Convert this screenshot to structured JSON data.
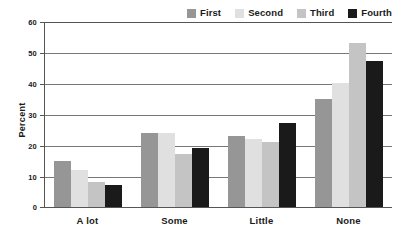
{
  "chart_data": {
    "type": "bar",
    "title": "",
    "subtitle": "",
    "xlabel": "",
    "ylabel": "Percent",
    "ylim": [
      0,
      60
    ],
    "yticks": [
      0,
      10,
      20,
      30,
      40,
      50,
      60
    ],
    "ytick_labels": [
      "0",
      "10",
      "20",
      "30",
      "40",
      "50",
      "60"
    ],
    "grid": true,
    "grid_axis": "y",
    "legend_position": "top-right",
    "categories": [
      "A lot",
      "Some",
      "Little",
      "None"
    ],
    "series": [
      {
        "name": "First",
        "color": "#969696",
        "values": [
          15,
          24,
          23,
          35
        ]
      },
      {
        "name": "Second",
        "color": "#e0e0e0",
        "values": [
          12,
          24,
          22,
          40
        ]
      },
      {
        "name": "Third",
        "color": "#c4c4c4",
        "values": [
          8,
          17,
          21,
          53
        ]
      },
      {
        "name": "Fourth",
        "color": "#1a1a1a",
        "values": [
          7,
          19,
          27,
          47
        ]
      }
    ]
  },
  "legend": {
    "items": [
      {
        "label": "First",
        "color": "#969696"
      },
      {
        "label": "Second",
        "color": "#e0e0e0"
      },
      {
        "label": "Third",
        "color": "#c4c4c4"
      },
      {
        "label": "Fourth",
        "color": "#1a1a1a"
      }
    ]
  },
  "axes": {
    "y_title": "Percent",
    "y_ticks": [
      "60",
      "50",
      "40",
      "30",
      "20",
      "10",
      "0"
    ],
    "x_ticks": [
      "A lot",
      "Some",
      "Little",
      "None"
    ]
  }
}
